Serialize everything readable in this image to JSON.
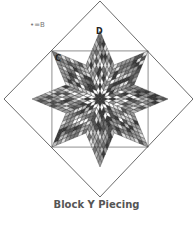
{
  "figure": {
    "caption": "Block Y Piecing",
    "legend": "•=B",
    "labels": [
      {
        "id": "D",
        "text": "D",
        "x": 96,
        "y": 28
      },
      {
        "id": "C",
        "text": "C",
        "x": 55,
        "y": 55
      }
    ],
    "outer_diamond": {
      "top": [
        100,
        1
      ],
      "right": [
        193,
        99
      ],
      "bottom": [
        100,
        197
      ],
      "left": [
        4,
        99
      ]
    },
    "center": [
      100,
      99
    ],
    "star": {
      "points": 8,
      "arm_length": 68,
      "arm_half_width": 28,
      "grid_rows": 8,
      "palette": [
        "#ffffff",
        "#e2e2e2",
        "#bdbdbd",
        "#9a9a9a",
        "#767676",
        "#555555",
        "#3a3a3a"
      ],
      "line_color": "#222222"
    },
    "colors": {
      "outline": "#444444",
      "background": "#ffffff",
      "caption": "#555555"
    }
  }
}
